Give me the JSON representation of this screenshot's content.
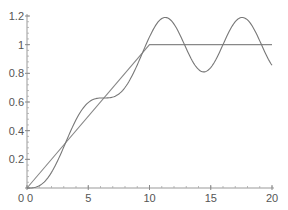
{
  "chart_data": {
    "type": "line",
    "title": "",
    "xlabel": "",
    "ylabel": "",
    "xlim": [
      0,
      20
    ],
    "ylim": [
      0,
      1.2
    ],
    "grid": false,
    "legend": null,
    "x_ticks": [
      0,
      5,
      10,
      15,
      20
    ],
    "y_ticks": [
      0,
      0.2,
      0.4,
      0.6,
      0.8,
      1,
      1.2
    ],
    "x_tick_labels": [
      "0",
      "5",
      "10",
      "15",
      "20"
    ],
    "y_tick_labels": [
      "0",
      "0.2",
      "0.4",
      "0.6",
      "0.8",
      "1",
      "1.2"
    ],
    "series": [
      {
        "name": "ramp-saturation",
        "color": "#888888",
        "x": [
          0,
          10,
          20
        ],
        "y": [
          0,
          1.0,
          1.0
        ]
      },
      {
        "name": "oscillating-response",
        "color": "#777777",
        "x": [
          0,
          1,
          2,
          3,
          4,
          5,
          6,
          7,
          8,
          9,
          10,
          11,
          11.3,
          12,
          13,
          14,
          14.4,
          15,
          16,
          17,
          17.6,
          18,
          19,
          20
        ],
        "y": [
          0,
          0.016,
          0.109,
          0.286,
          0.476,
          0.596,
          0.628,
          0.634,
          0.701,
          0.859,
          1.054,
          1.19,
          1.19,
          1.14,
          0.95,
          0.83,
          0.81,
          0.84,
          0.99,
          1.16,
          1.19,
          1.18,
          1.03,
          0.86
        ]
      }
    ]
  }
}
